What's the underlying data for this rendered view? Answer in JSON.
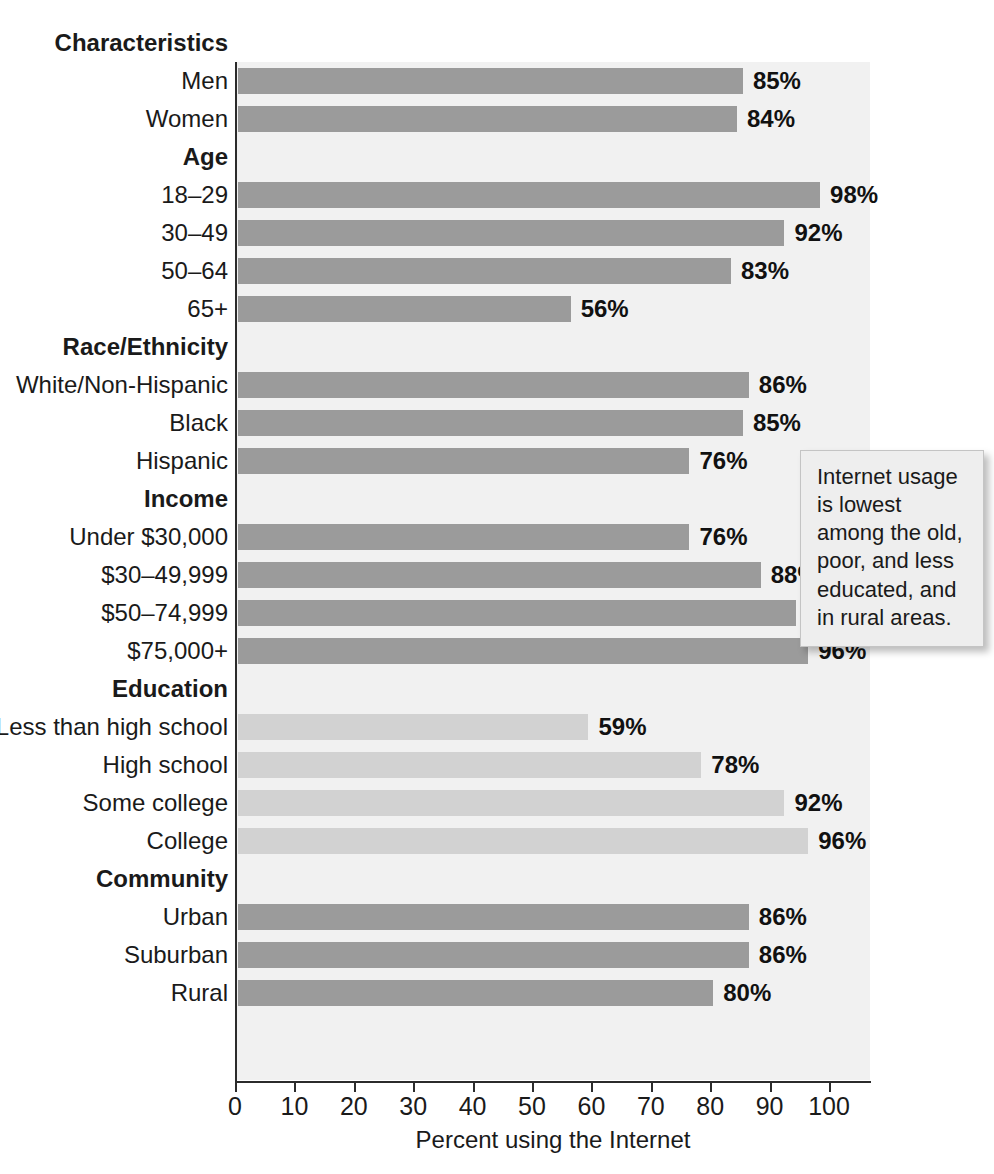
{
  "chart_data": {
    "type": "bar",
    "orientation": "horizontal",
    "title": "",
    "xlabel": "Percent using the Internet",
    "ylabel": "",
    "xlim": [
      0,
      100
    ],
    "xticks": [
      "0",
      "10",
      "20",
      "30",
      "40",
      "50",
      "60",
      "70",
      "80",
      "90",
      "100"
    ],
    "grid": false,
    "legend": "none",
    "value_suffix": "%",
    "colors": {
      "bar_dark": "#9b9b9b",
      "bar_light": "#d2d2d2",
      "plot_bg": "#f1f1f1",
      "axis": "#2b2b2b"
    },
    "groups": [
      {
        "header": "Characteristics",
        "shade": "dark",
        "categories": [
          "Men",
          "Women"
        ],
        "values": [
          85,
          84
        ],
        "labels": [
          "85%",
          "84%"
        ]
      },
      {
        "header": "Age",
        "shade": "dark",
        "categories": [
          "18–29",
          "30–49",
          "50–64",
          "65+"
        ],
        "values": [
          98,
          92,
          83,
          56
        ],
        "labels": [
          "98%",
          "92%",
          "83%",
          "56%"
        ]
      },
      {
        "header": "Race/Ethnicity",
        "shade": "dark",
        "categories": [
          "White/Non-Hispanic",
          "Black",
          "Hispanic"
        ],
        "values": [
          86,
          85,
          76
        ],
        "labels": [
          "86%",
          "85%",
          "76%"
        ]
      },
      {
        "header": "Income",
        "shade": "dark",
        "categories": [
          "Under $30,000",
          "$30–49,999",
          "$50–74,999",
          "$75,000+"
        ],
        "values": [
          76,
          88,
          94,
          96
        ],
        "labels": [
          "76%",
          "88%",
          "94%",
          "96%"
        ]
      },
      {
        "header": "Education",
        "shade": "light",
        "categories": [
          "Less than high school",
          "High school",
          "Some college",
          "College"
        ],
        "values": [
          59,
          78,
          92,
          96
        ],
        "labels": [
          "59%",
          "78%",
          "92%",
          "96%"
        ]
      },
      {
        "header": "Community",
        "shade": "dark",
        "categories": [
          "Urban",
          "Suburban",
          "Rural"
        ],
        "values": [
          86,
          86,
          80
        ],
        "labels": [
          "86%",
          "86%",
          "80%"
        ]
      }
    ]
  },
  "callout": {
    "text": "Internet usage is lowest among the old, poor, and less educated, and in rural areas."
  }
}
